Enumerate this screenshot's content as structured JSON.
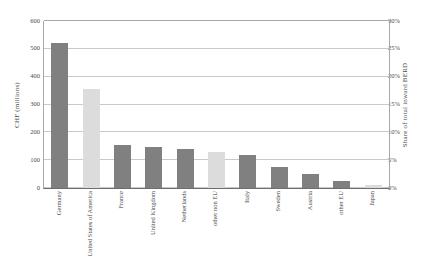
{
  "chart_data": {
    "type": "bar",
    "title": "",
    "subtitle": "",
    "categories": [
      "Germany",
      "United States of America",
      "France",
      "United Kingdom",
      "Netherlands",
      "other non EU",
      "Italy",
      "Sweden",
      "Austria",
      "other EU",
      "Japan"
    ],
    "values": [
      520,
      355,
      155,
      148,
      140,
      128,
      118,
      75,
      50,
      25,
      10
    ],
    "bar_colors": [
      "#808080",
      "#dcdcdc",
      "#808080",
      "#808080",
      "#808080",
      "#dcdcdc",
      "#808080",
      "#808080",
      "#808080",
      "#808080",
      "#dcdcdc"
    ],
    "xlabel": "",
    "ylabel": "CHF (millions)",
    "ylim": [
      0,
      600
    ],
    "yticks": [
      0,
      100,
      200,
      300,
      400,
      500,
      600
    ],
    "ytick_labels": [
      "0",
      "100",
      "200",
      "300",
      "400",
      "500",
      "600"
    ],
    "y2label": "Share of total inward BERD",
    "y2lim": [
      0,
      30
    ],
    "y2ticks": [
      0,
      5,
      10,
      15,
      20,
      25,
      30
    ],
    "y2tick_labels": [
      "0%",
      "5%",
      "10%",
      "15%",
      "20%",
      "25%",
      "30%"
    ],
    "grid": true,
    "legend": null,
    "secondary_axis_ratio": "600 CHF millions = 30% share"
  }
}
